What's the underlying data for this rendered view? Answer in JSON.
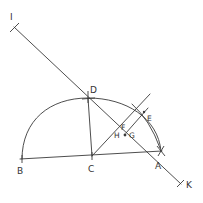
{
  "diagram": {
    "type": "geometric-construction",
    "colors": {
      "ink": "#3a3a3a",
      "background": "#ffffff"
    },
    "points": {
      "I": {
        "label": "I",
        "x": 14,
        "y": 27
      },
      "D": {
        "label": "D",
        "x": 88,
        "y": 98
      },
      "E": {
        "label": "E",
        "x": 146,
        "y": 111
      },
      "F": {
        "label": "F",
        "x": 126,
        "y": 128
      },
      "G": {
        "label": "G",
        "x": 128,
        "y": 135
      },
      "H": {
        "label": "H",
        "x": 122,
        "y": 135
      },
      "B": {
        "label": "B",
        "x": 22,
        "y": 159
      },
      "C": {
        "label": "C",
        "x": 92,
        "y": 156
      },
      "A": {
        "label": "A",
        "x": 161,
        "y": 151
      },
      "K": {
        "label": "K",
        "x": 181,
        "y": 184
      }
    },
    "segments": [
      {
        "name": "line-IK",
        "from": "I",
        "to": "K"
      },
      {
        "name": "diameter-BA",
        "from": "B",
        "to": "A"
      },
      {
        "name": "segment-CD",
        "from": "C",
        "to": "D"
      },
      {
        "name": "line-CE",
        "from": "C",
        "to": "E-extended"
      }
    ],
    "arcs": [
      {
        "name": "semicircle",
        "center": "C",
        "from": "B",
        "to": "A",
        "through": "D"
      },
      {
        "name": "arc-through-E",
        "center": "D",
        "through": "E"
      }
    ]
  }
}
